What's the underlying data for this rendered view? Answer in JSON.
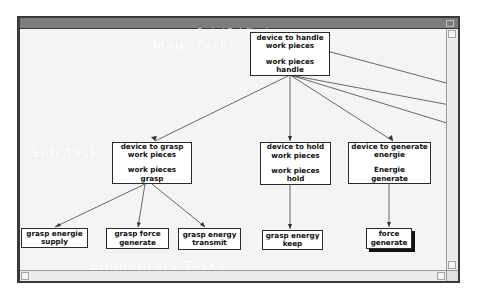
{
  "window": {
    "title": "Product Task Structure"
  },
  "levels": {
    "main": "Main Tasks",
    "sub": "Sub Tasks",
    "elementary": "Elementary Tasks"
  },
  "tree": {
    "root": {
      "function": [
        "device to handle",
        "work pieces"
      ],
      "task": [
        "work pieces",
        "handle"
      ]
    },
    "sub_tasks": [
      {
        "function": [
          "device to grasp",
          "work pieces"
        ],
        "task": [
          "work pieces",
          "grasp"
        ]
      },
      {
        "function": [
          "device to hold",
          "work pieces"
        ],
        "task": [
          "work pieces",
          "hold"
        ]
      },
      {
        "function": [
          "device to generate",
          "energie"
        ],
        "task": [
          "Energie",
          "generate"
        ]
      }
    ],
    "elementary_tasks": [
      {
        "lines": [
          "grasp energie",
          "supply"
        ],
        "parent": 0
      },
      {
        "lines": [
          "grasp force",
          "generate"
        ],
        "parent": 0
      },
      {
        "lines": [
          "grasp energy",
          "transmit"
        ],
        "parent": 0
      },
      {
        "lines": [
          "grasp energy",
          "keep"
        ],
        "parent": 1
      },
      {
        "lines": [
          "force",
          "generate"
        ],
        "parent": 2,
        "selected": true
      }
    ]
  },
  "colors": {
    "titlebar": "#7d7d7d",
    "canvas": "#f4f4f4",
    "node_border": "#2a2a2a",
    "edge": "#444444"
  }
}
